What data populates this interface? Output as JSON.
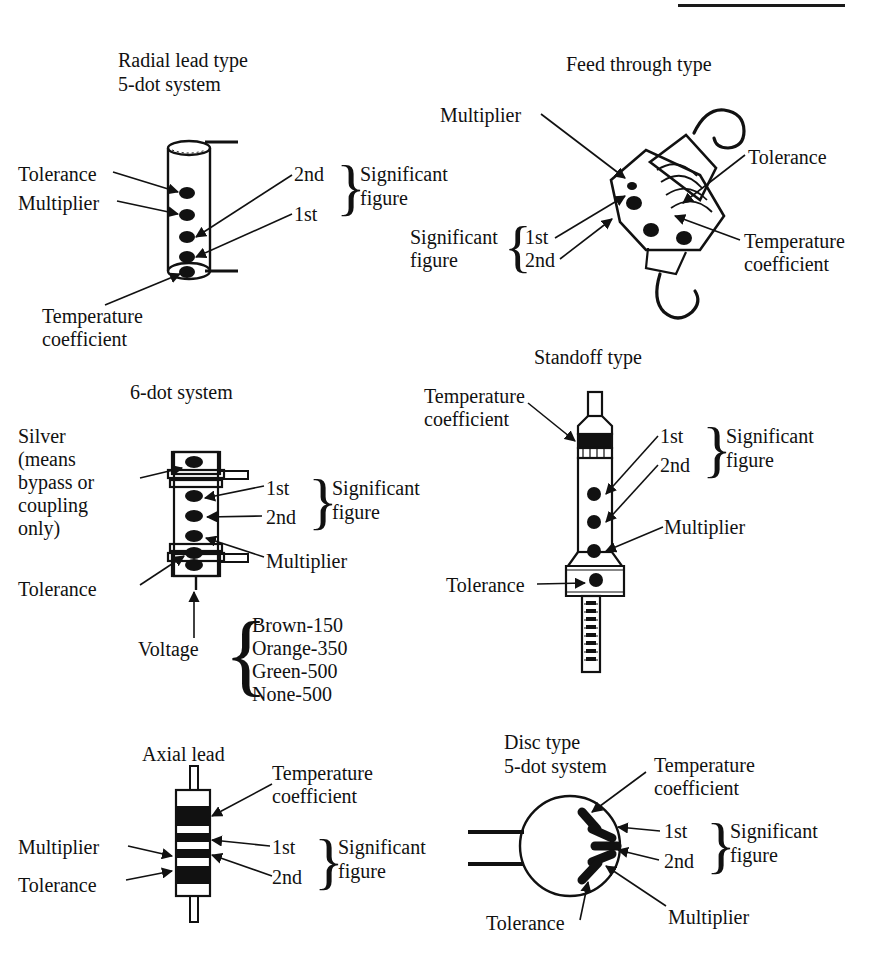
{
  "page": {
    "ink_color": "#111111",
    "background": "#ffffff"
  },
  "sections": [
    {
      "id": "radial-lead",
      "heading_line1": "Radial lead type",
      "heading_line2": "5-dot system",
      "labels": {
        "tolerance": "Tolerance",
        "multiplier": "Multiplier",
        "temperature_line1": "Temperature",
        "temperature_line2": "coefficient",
        "second": "2nd",
        "first": "1st",
        "significant_line1": "Significant",
        "significant_line2": "figure"
      },
      "dot_count": 5
    },
    {
      "id": "feed-through",
      "heading_line1": "Feed through type",
      "heading_line2": "",
      "labels": {
        "multiplier": "Multiplier",
        "tolerance": "Tolerance",
        "temperature_line1": "Temperature",
        "temperature_line2": "coefficient",
        "significant_line1": "Significant",
        "significant_line2": "figure",
        "first": "1st",
        "second": "2nd"
      },
      "dot_count": 4
    },
    {
      "id": "six-dot",
      "heading_line1": "6-dot system",
      "heading_line2": "",
      "labels": {
        "silver_line1": "Silver",
        "silver_line2": "(means",
        "silver_line3": "bypass or",
        "silver_line4": "coupling",
        "silver_line5": "only)",
        "tolerance": "Tolerance",
        "first": "1st",
        "second": "2nd",
        "significant_line1": "Significant",
        "significant_line2": "figure",
        "multiplier": "Multiplier",
        "voltage": "Voltage"
      },
      "voltage_codes": [
        "Brown-150",
        "Orange-350",
        "Green-500",
        "None-500"
      ],
      "dot_count": 6
    },
    {
      "id": "standoff",
      "heading_line1": "Standoff type",
      "heading_line2": "",
      "labels": {
        "temperature_line1": "Temperature",
        "temperature_line2": "coefficient",
        "first": "1st",
        "second": "2nd",
        "significant_line1": "Significant",
        "significant_line2": "figure",
        "multiplier": "Multiplier",
        "tolerance": "Tolerance"
      },
      "dot_count": 4
    },
    {
      "id": "axial-lead",
      "heading_line1": "Axial lead",
      "heading_line2": "",
      "labels": {
        "temperature_line1": "Temperature",
        "temperature_line2": "coefficient",
        "multiplier": "Multiplier",
        "tolerance": "Tolerance",
        "first": "1st",
        "second": "2nd",
        "significant_line1": "Significant",
        "significant_line2": "figure"
      },
      "band_count": 4
    },
    {
      "id": "disc-type",
      "heading_line1": "Disc type",
      "heading_line2": "5-dot system",
      "labels": {
        "temperature_line1": "Temperature",
        "temperature_line2": "coefficient",
        "first": "1st",
        "second": "2nd",
        "significant_line1": "Significant",
        "significant_line2": "figure",
        "multiplier": "Multiplier",
        "tolerance": "Tolerance"
      },
      "bar_count": 5
    }
  ],
  "braces": {
    "glyph": "}",
    "left_glyph": "{"
  }
}
